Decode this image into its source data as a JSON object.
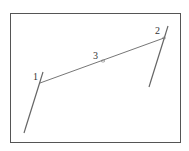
{
  "diagram": {
    "frame": {
      "x": 10,
      "y": 13,
      "width": 170,
      "height": 129,
      "color": "#555555"
    },
    "line_color": "#666666",
    "label_color": "#333333",
    "lines": [
      {
        "name": "left-line",
        "x1": 24,
        "y1": 133,
        "x2": 43,
        "y2": 72
      },
      {
        "name": "right-line",
        "x1": 168,
        "y1": 26,
        "x2": 149,
        "y2": 87
      },
      {
        "name": "connector-line",
        "x1": 40,
        "y1": 83,
        "x2": 164,
        "y2": 38
      }
    ],
    "points": [
      {
        "label": "1",
        "x": 40,
        "y": 83,
        "label_x": 33,
        "label_y": 80
      },
      {
        "label": "2",
        "x": 164,
        "y": 38,
        "label_x": 155,
        "label_y": 34
      },
      {
        "label": "3",
        "x": 103,
        "y": 61,
        "label_x": 93,
        "label_y": 59
      }
    ]
  }
}
